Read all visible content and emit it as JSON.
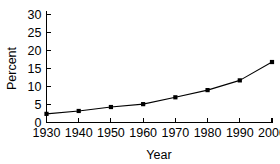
{
  "chart_data": {
    "type": "line",
    "title": "",
    "xlabel": "Year",
    "ylabel": "Percent",
    "x": [
      1930,
      1940,
      1950,
      1960,
      1970,
      1980,
      1990,
      2000
    ],
    "values": [
      2.4,
      3.2,
      4.3,
      5.1,
      7.0,
      9.0,
      11.7,
      16.8
    ],
    "series": [
      {
        "name": "Percent",
        "values": [
          2.4,
          3.2,
          4.3,
          5.1,
          7.0,
          9.0,
          11.7,
          16.8
        ]
      }
    ],
    "xtick_labels": [
      "1930",
      "1940",
      "1950",
      "1960",
      "1970",
      "1980",
      "1990",
      "2000"
    ],
    "ytick_labels": [
      "0",
      "5",
      "10",
      "15",
      "20",
      "25",
      "30"
    ],
    "ytick_values": [
      0,
      5,
      10,
      15,
      20,
      25,
      30
    ],
    "xlim": [
      1930,
      2000
    ],
    "ylim": [
      0,
      31.5
    ],
    "grid": false,
    "legend": false,
    "legend_position": "none",
    "marker": "square",
    "line_color": "#000000",
    "marker_color": "#000000",
    "background_color": "#ffffff",
    "spines": [
      "left",
      "bottom"
    ],
    "tick_direction": "in"
  }
}
